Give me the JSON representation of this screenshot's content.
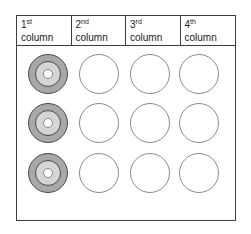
{
  "figure": {
    "background": "#ffffff",
    "panel_border_color": "#3d3d3d"
  },
  "header": {
    "columns": [
      {
        "number": "1",
        "ordinal": "st",
        "label": "column"
      },
      {
        "number": "2",
        "ordinal": "nd",
        "label": "column"
      },
      {
        "number": "3",
        "ordinal": "rd",
        "label": "column"
      },
      {
        "number": "4",
        "ordinal": "th",
        "label": "column"
      }
    ]
  },
  "grid": {
    "rows": 3,
    "cols": 4,
    "cells": [
      [
        "target",
        "empty",
        "empty",
        "empty"
      ],
      [
        "target",
        "empty",
        "empty",
        "empty"
      ],
      [
        "target",
        "empty",
        "empty",
        "empty"
      ]
    ]
  },
  "colors": {
    "target_outer": "#a8a8a8",
    "target_middle": "#d5d5d5",
    "target_center": "#ffffff",
    "target_outline": "#4a4a4a",
    "empty_fill": "#ffffff",
    "empty_outline": "#8a8a8a"
  }
}
